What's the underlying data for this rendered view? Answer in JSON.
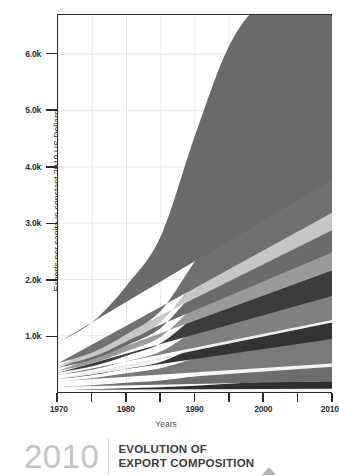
{
  "chart_data": {
    "type": "area",
    "title": "EVOLUTION OF EXPORT COMPOSITION",
    "xlabel": "Years",
    "ylabel": "Exports per capita in constant 2010 US Dollars",
    "grid": true,
    "legend_position": "none",
    "stacked": true,
    "xlim": [
      1970,
      2010
    ],
    "ylim": [
      0,
      6700
    ],
    "x": [
      1970,
      1975,
      1980,
      1985,
      1990,
      1995,
      2000,
      2005,
      2010
    ],
    "xticks": [
      1970,
      1975,
      1980,
      1985,
      1990,
      1995,
      2000,
      2005,
      2010
    ],
    "xtick_labels": [
      "1970",
      "",
      "1980",
      "",
      "1990",
      "",
      "2000",
      "",
      "2010"
    ],
    "yticks": [
      1000,
      2000,
      3000,
      4000,
      5000,
      6000
    ],
    "ytick_labels": [
      "1.0k",
      "2.0k",
      "3.0k",
      "4.0k",
      "5.0k",
      "6.0k"
    ],
    "series": [
      {
        "name": "layer-01",
        "color": "#f2f2f2",
        "values": [
          20,
          26,
          34,
          40,
          48,
          52,
          56,
          58,
          60
        ]
      },
      {
        "name": "layer-02",
        "color": "#2e2e2e",
        "values": [
          18,
          24,
          34,
          44,
          62,
          96,
          120,
          128,
          132
        ]
      },
      {
        "name": "layer-03",
        "color": "#6e6e6e",
        "values": [
          55,
          70,
          96,
          120,
          168,
          210,
          238,
          250,
          258
        ]
      },
      {
        "name": "layer-04",
        "color": "#f4f4f4",
        "values": [
          12,
          16,
          20,
          24,
          34,
          44,
          52,
          56,
          58
        ]
      },
      {
        "name": "layer-05",
        "color": "#7a7a7a",
        "values": [
          86,
          110,
          150,
          196,
          286,
          360,
          404,
          424,
          436
        ]
      },
      {
        "name": "layer-06",
        "color": "#333333",
        "values": [
          38,
          54,
          78,
          110,
          196,
          272,
          300,
          296,
          292
        ]
      },
      {
        "name": "layer-07",
        "color": "#ededed",
        "values": [
          10,
          12,
          16,
          20,
          28,
          34,
          38,
          40,
          42
        ]
      },
      {
        "name": "layer-08",
        "color": "#808080",
        "values": [
          60,
          82,
          120,
          168,
          268,
          358,
          404,
          420,
          430
        ]
      },
      {
        "name": "layer-09",
        "color": "#3c3c3c",
        "values": [
          44,
          62,
          96,
          144,
          250,
          352,
          412,
          438,
          452
        ]
      },
      {
        "name": "layer-10",
        "color": "#9a9a9a",
        "values": [
          36,
          52,
          80,
          118,
          196,
          268,
          302,
          312,
          318
        ]
      },
      {
        "name": "layer-11",
        "color": "#6b6b6b",
        "values": [
          48,
          68,
          104,
          154,
          254,
          340,
          382,
          392,
          398
        ]
      },
      {
        "name": "layer-12",
        "color": "#c6c6c6",
        "values": [
          30,
          44,
          70,
          106,
          182,
          250,
          286,
          300,
          308
        ]
      },
      {
        "name": "layer-13",
        "color": "#707070",
        "values": [
          54,
          80,
          128,
          198,
          352,
          486,
          556,
          578,
          590
        ]
      },
      {
        "name": "layer-14",
        "color": "#6a6a6a",
        "values": [
          369,
          542,
          864,
          1328,
          2236,
          3038,
          3400,
          3478,
          3726
        ]
      }
    ],
    "totals": [
      880,
      1242,
      1890,
      2770,
      4510,
      6160,
      6950,
      7170,
      7500
    ]
  },
  "axis": {
    "y_title": "Exports per capita in constant 2010 US Dollars",
    "x_title": "Years"
  },
  "footer": {
    "year": "2010",
    "title_line_1": "EVOLUTION OF",
    "title_line_2": "EXPORT COMPOSITION"
  },
  "colors": {
    "axis": "#2b2b2b",
    "grid": "#e8e8e8",
    "background": "#ffffff",
    "footer_year": "#c3c3c3",
    "footer_title": "#3d3d3d",
    "footer_triangle": "#b4b4b4"
  }
}
